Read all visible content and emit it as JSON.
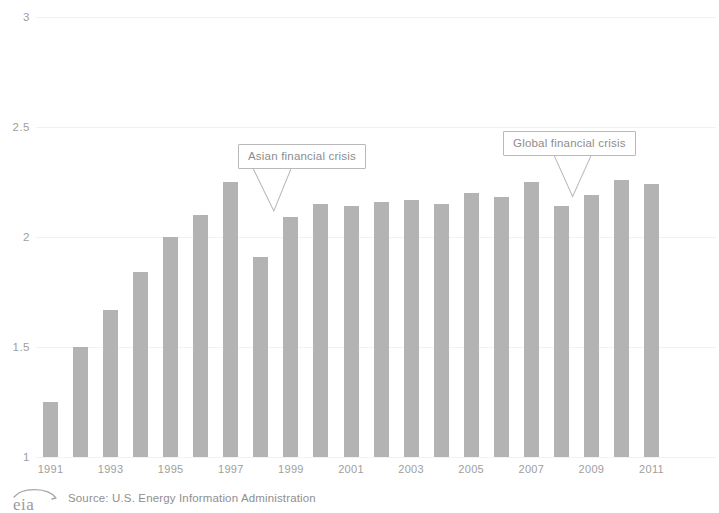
{
  "chart_data": {
    "type": "bar",
    "title": "",
    "subtitle": "",
    "xlabel": "",
    "ylabel": "",
    "categories": [
      "1991",
      "1992",
      "1993",
      "1994",
      "1995",
      "1996",
      "1997",
      "1998",
      "1999",
      "2000",
      "2001",
      "2002",
      "2003",
      "2004",
      "2005",
      "2006",
      "2007",
      "2008",
      "2009",
      "2010",
      "2011"
    ],
    "values": [
      1.25,
      1.5,
      1.67,
      1.84,
      2.0,
      2.1,
      2.25,
      1.91,
      2.09,
      2.15,
      2.14,
      2.16,
      2.17,
      2.15,
      2.2,
      2.18,
      2.25,
      2.14,
      2.19,
      2.26,
      2.24
    ],
    "ylim": [
      1,
      3
    ],
    "y_ticks": [
      "1",
      "1.5",
      "2",
      "2.5",
      "3"
    ],
    "y_tick_values": [
      1,
      1.5,
      2,
      2.5,
      3
    ],
    "x_tick_labels": [
      "1991",
      "1993",
      "1995",
      "1997",
      "1999",
      "2001",
      "2003",
      "2005",
      "2007",
      "2009",
      "2011"
    ],
    "grid": true,
    "legend": "none",
    "bar_color": "#b3b3b3",
    "grid_color": "#f2f2f2",
    "text_color": "#9e9e9e",
    "annotations": [
      {
        "label": "Asian financial crisis",
        "target_category": "1998"
      },
      {
        "label": "Global financial crisis",
        "target_category": "2008"
      }
    ]
  },
  "footer": {
    "logo_text": "eia",
    "source": "Source: U.S. Energy Information Administration"
  }
}
